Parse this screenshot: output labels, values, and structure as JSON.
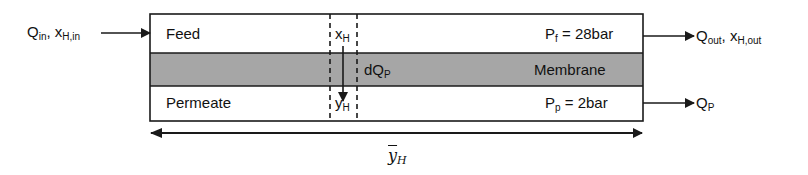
{
  "diagram": {
    "type": "membrane-module-schematic",
    "colors": {
      "membrane": "#a6a6a6",
      "stroke": "#1a1a1a",
      "background": "#ffffff"
    },
    "inlet": {
      "q": "Q",
      "q_sub": "in",
      "x": "x",
      "x_sub": "H,in"
    },
    "outlet_retentate": {
      "q": "Q",
      "q_sub": "out",
      "x": "x",
      "x_sub": "H,out"
    },
    "outlet_permeate": {
      "q": "Q",
      "q_sub": "P"
    },
    "feed": {
      "label": "Feed",
      "pressure_symbol": "P",
      "pressure_sub": "f",
      "pressure_value": "= 28bar"
    },
    "membrane": {
      "label": "Membrane",
      "flux": "dQ",
      "flux_sub": "P"
    },
    "permeate": {
      "label": "Permeate",
      "pressure_symbol": "P",
      "pressure_sub": "p",
      "pressure_value": "= 2bar"
    },
    "element": {
      "feed_fraction": "x",
      "feed_fraction_sub": "H",
      "permeate_fraction": "y",
      "permeate_fraction_sub": "H"
    },
    "average": {
      "symbol": "y",
      "sub": "H"
    }
  }
}
